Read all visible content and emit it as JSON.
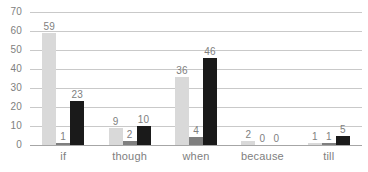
{
  "chart_data": {
    "type": "bar",
    "title": "",
    "subtitle": "",
    "xlabel": "",
    "ylabel": "",
    "categories": [
      "if",
      "though",
      "when",
      "because",
      "till"
    ],
    "series": [
      {
        "name": "series-1",
        "color": "#d9d9d9",
        "values": [
          59,
          9,
          36,
          2,
          1
        ]
      },
      {
        "name": "series-2",
        "color": "#7f7f7f",
        "values": [
          1,
          2,
          4,
          0,
          1
        ]
      },
      {
        "name": "series-3",
        "color": "#1a1a1a",
        "values": [
          23,
          10,
          46,
          0,
          5
        ]
      }
    ],
    "ylim": [
      0,
      70
    ],
    "yticks": [
      0,
      10,
      20,
      30,
      40,
      50,
      60,
      70
    ],
    "ytick_labels": [
      "0",
      "10",
      "20",
      "30",
      "40",
      "50",
      "60",
      "70"
    ],
    "data_labels": [
      [
        "59",
        "1",
        "23"
      ],
      [
        "9",
        "2",
        "10"
      ],
      [
        "36",
        "4",
        "46"
      ],
      [
        "2",
        "0",
        "0"
      ],
      [
        "1",
        "1",
        "5"
      ]
    ],
    "grid": true,
    "grid_axis": "y",
    "legend": "none",
    "legend_position": "none",
    "bar_orientation": "vertical",
    "axis_color": "#a6a6a6",
    "grid_color": "#c9c9c9",
    "text_color": "#808080",
    "background": "#ffffff"
  }
}
